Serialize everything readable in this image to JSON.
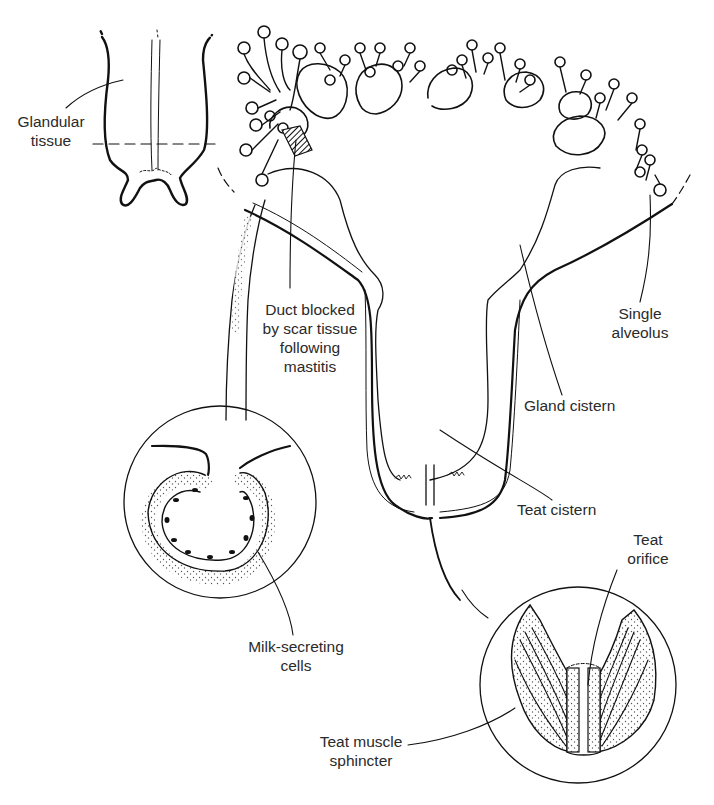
{
  "diagram": {
    "colors": {
      "line": "#1a1a1a",
      "text": "#2a2a2a",
      "background": "#ffffff",
      "stipple": "#555555"
    },
    "labels": {
      "glandular_tissue": "Glandular\ntissue",
      "duct_blocked": "Duct blocked\nby scar tissue\nfollowing\nmastitis",
      "single_alveolus": "Single\nalveolus",
      "gland_cistern": "Gland cistern",
      "teat_cistern": "Teat cistern",
      "teat_orifice": "Teat\norifice",
      "milk_secreting_cells": "Milk-secreting\ncells",
      "teat_muscle_sphincter": "Teat muscle\nsphincter"
    },
    "insets": [
      {
        "name": "udder-overview",
        "description": "Small outline of whole udder with dashed line marking glandular tissue level"
      },
      {
        "name": "alveolus-magnified",
        "description": "Circular inset showing ring of milk-secreting cells"
      },
      {
        "name": "teat-end-magnified",
        "description": "Circular inset showing teat sphincter muscle and orifice"
      }
    ]
  }
}
